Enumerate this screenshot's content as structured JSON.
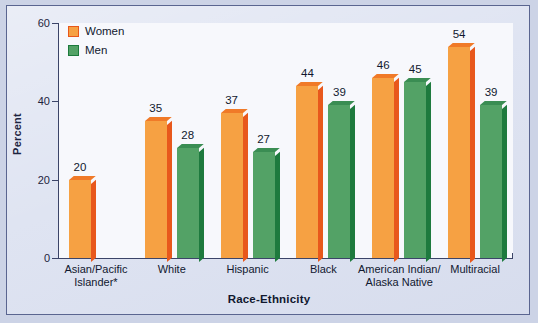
{
  "chart_data": {
    "type": "bar",
    "title": "",
    "xlabel": "Race-Ethnicity",
    "ylabel": "Percent",
    "ylim": [
      0,
      60
    ],
    "yticks": [
      0,
      20,
      40,
      60
    ],
    "ytick_labels": [
      "0",
      "20",
      "40",
      "60"
    ],
    "grid": false,
    "legend_position": "top-left",
    "categories": [
      "Asian/Pacific Islander*",
      "White",
      "Hispanic",
      "Black",
      "American Indian/ Alaska Native",
      "Multiracial"
    ],
    "category_lines": [
      [
        "Asian/Pacific",
        "Islander*"
      ],
      [
        "White"
      ],
      [
        "Hispanic"
      ],
      [
        "Black"
      ],
      [
        "American Indian/",
        "Alaska Native"
      ],
      [
        "Multiracial"
      ]
    ],
    "series": [
      {
        "name": "Women",
        "color": "#f6a143",
        "values": [
          20,
          35,
          37,
          44,
          46,
          54
        ],
        "value_labels": [
          "20",
          "35",
          "37",
          "44",
          "46",
          "54"
        ]
      },
      {
        "name": "Men",
        "color": "#53a266",
        "values": [
          null,
          28,
          27,
          39,
          45,
          39
        ],
        "value_labels": [
          "",
          "28",
          "27",
          "39",
          "45",
          "39"
        ]
      }
    ]
  },
  "legend": {
    "items": [
      {
        "label": "Women",
        "swatch": "women-swatch"
      },
      {
        "label": "Men",
        "swatch": "men-swatch"
      }
    ]
  },
  "axes": {
    "y_title": "Percent",
    "x_title": "Race-Ethnicity",
    "y_tick_0": "0",
    "y_tick_1": "20",
    "y_tick_2": "40",
    "y_tick_3": "60"
  },
  "colors": {
    "women_face": "#f6a143",
    "women_side": "#e8581c",
    "men_face": "#53a266",
    "men_side": "#1e7a3e",
    "card_background": "#dfe4f2",
    "plot_background": "#f7f8fc",
    "axis": "#3b4468",
    "text": "#11182f"
  }
}
